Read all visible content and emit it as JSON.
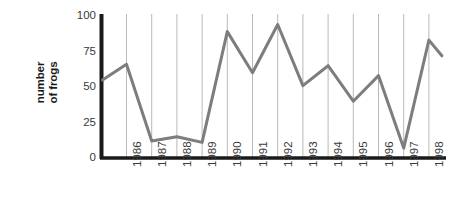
{
  "chart_data": {
    "type": "line",
    "title": "",
    "xlabel": "",
    "ylabel": "number of frogs",
    "ylabel_lines": [
      "number",
      "of frogs"
    ],
    "categories": [
      "1986",
      "1987",
      "1988",
      "1989",
      "1990",
      "1991",
      "1992",
      "1993",
      "1994",
      "1995",
      "1996",
      "1997",
      "1998"
    ],
    "values": [
      66,
      12,
      15,
      11,
      89,
      60,
      94,
      51,
      65,
      40,
      58,
      7,
      83
    ],
    "lead_in_value": 55,
    "lead_out_value": 72,
    "yticks": [
      "0",
      "25",
      "50",
      "75",
      "100"
    ],
    "ytick_values": [
      0,
      25,
      50,
      75,
      100
    ],
    "ylim": [
      0,
      100
    ],
    "grid": "vertical",
    "legend": "none",
    "series": [
      {
        "name": "number of frogs",
        "color": "#7d7d7d",
        "values": [
          66,
          12,
          15,
          11,
          89,
          60,
          94,
          51,
          65,
          40,
          58,
          7,
          83
        ]
      }
    ]
  },
  "style": {
    "line_color": "#7d7d7d",
    "axis_color": "#1a1a1a",
    "grid_color": "#b9b9b9",
    "text_color": "#3a3a3a",
    "background": "#ffffff"
  }
}
